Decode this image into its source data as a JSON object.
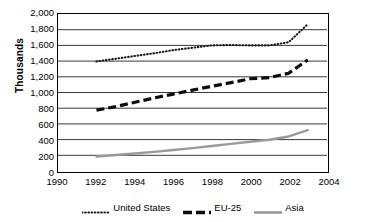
{
  "chart_data": {
    "type": "line",
    "title": "",
    "subtitle": "",
    "xlabel": "",
    "ylabel": "Thousands",
    "xlim": [
      1990,
      2004
    ],
    "ylim": [
      0,
      2000
    ],
    "ytick_step": 200,
    "xtick_step": 2,
    "grid": "horizontal",
    "legend_position": "bottom",
    "ytick_labels": [
      "2,000",
      "1,800",
      "1,600",
      "1,400",
      "1,200",
      "1,000",
      "800",
      "600",
      "400",
      "200",
      "0"
    ],
    "ytick_values": [
      2000,
      1800,
      1600,
      1400,
      1200,
      1000,
      800,
      600,
      400,
      200,
      0
    ],
    "xtick_labels": [
      "1990",
      "1992",
      "1994",
      "1996",
      "1998",
      "2000",
      "2002",
      "2004"
    ],
    "xtick_values": [
      1990,
      1992,
      1994,
      1996,
      1998,
      2000,
      2002,
      2004
    ],
    "x": [
      1992,
      1993,
      1994,
      1995,
      1996,
      1997,
      1998,
      1999,
      2000,
      2001,
      2002,
      2003
    ],
    "series": [
      {
        "name": "United States",
        "style": "dotted",
        "color": "#1a1a1a",
        "values": [
          1395,
          1430,
          1465,
          1500,
          1540,
          1570,
          1600,
          1605,
          1600,
          1600,
          1640,
          1870
        ]
      },
      {
        "name": "EU-25",
        "style": "dashed",
        "color": "#0d0d0d",
        "values": [
          775,
          820,
          875,
          930,
          980,
          1030,
          1080,
          1125,
          1175,
          1190,
          1245,
          1415
        ]
      },
      {
        "name": "Asia",
        "style": "solid",
        "color": "#9a9a9a",
        "values": [
          185,
          203,
          222,
          244,
          268,
          292,
          318,
          345,
          372,
          398,
          440,
          520
        ]
      }
    ]
  },
  "legend": {
    "items": [
      {
        "label": "United States",
        "marker": "dotted-line-swatch"
      },
      {
        "label": "EU-25",
        "marker": "dashed-line-swatch"
      },
      {
        "label": "Asia",
        "marker": "solid-line-swatch"
      }
    ]
  },
  "axes": {
    "y_title": "Thousands"
  },
  "colors": {
    "gridline": "#3a3a3a",
    "frame": "#000000",
    "us": "#1a1a1a",
    "eu": "#0d0d0d",
    "asia": "#9a9a9a",
    "background": "#ffffff"
  }
}
